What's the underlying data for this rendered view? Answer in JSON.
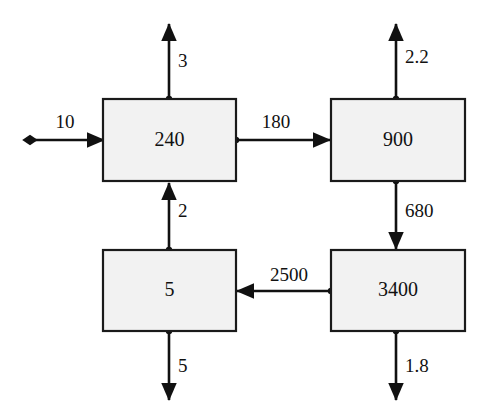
{
  "diagram": {
    "type": "block-flow-diagram",
    "colors": {
      "box_fill": "#f2f2f2",
      "box_stroke": "#1a1a1a",
      "arrow_stroke": "#111111",
      "background": "#ffffff"
    },
    "boxes": [
      {
        "id": "box-top-left",
        "label": "240",
        "x": 103,
        "y": 99,
        "w": 133,
        "h": 82
      },
      {
        "id": "box-top-right",
        "label": "900",
        "x": 331,
        "y": 99,
        "w": 134,
        "h": 82
      },
      {
        "id": "box-bottom-left",
        "label": "5",
        "x": 103,
        "y": 250,
        "w": 133,
        "h": 81
      },
      {
        "id": "box-bottom-right",
        "label": "3400",
        "x": 331,
        "y": 250,
        "w": 134,
        "h": 81
      }
    ],
    "arrows": [
      {
        "id": "arrow-inflow-left-240",
        "label": "10",
        "direction": "right",
        "from": "external",
        "to": "box-top-left"
      },
      {
        "id": "arrow-outflow-up-240",
        "label": "3",
        "direction": "up",
        "from": "box-top-left",
        "to": "external"
      },
      {
        "id": "arrow-240-to-900",
        "label": "180",
        "direction": "right",
        "from": "box-top-left",
        "to": "box-top-right"
      },
      {
        "id": "arrow-outflow-up-900",
        "label": "2.2",
        "direction": "up",
        "from": "box-top-right",
        "to": "external"
      },
      {
        "id": "arrow-900-to-3400",
        "label": "680",
        "direction": "down",
        "from": "box-top-right",
        "to": "box-bottom-right"
      },
      {
        "id": "arrow-3400-to-5",
        "label": "2500",
        "direction": "left",
        "from": "box-bottom-right",
        "to": "box-bottom-left"
      },
      {
        "id": "arrow-5-to-240",
        "label": "2",
        "direction": "up",
        "from": "box-bottom-left",
        "to": "box-top-left"
      },
      {
        "id": "arrow-outflow-down-5",
        "label": "5",
        "direction": "down",
        "from": "box-bottom-left",
        "to": "external"
      },
      {
        "id": "arrow-outflow-down-3400",
        "label": "1.8",
        "direction": "down",
        "from": "box-bottom-right",
        "to": "external"
      }
    ]
  }
}
